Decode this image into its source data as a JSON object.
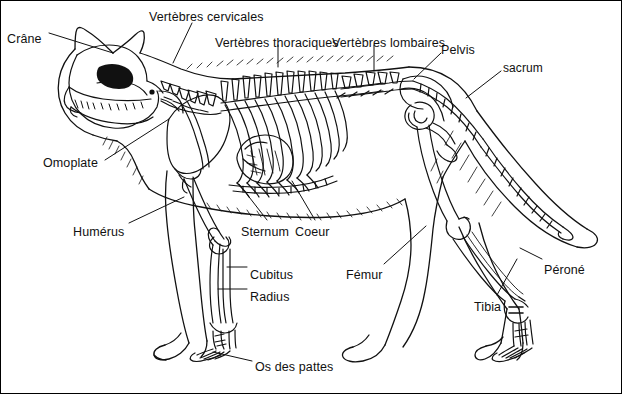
{
  "figure": {
    "language": "fr",
    "style": "line-drawing",
    "ink_color": "#111111",
    "background_color": "#ffffff",
    "border_color": "#000000",
    "width": 622,
    "height": 394
  },
  "labels": [
    {
      "id": "crane",
      "text": "Crâne",
      "x": 6,
      "y": 32
    },
    {
      "id": "vertebres-cervicales",
      "text": "Vertèbres cervicales",
      "x": 148,
      "y": 10
    },
    {
      "id": "vertebres-thoraciques",
      "text": "Vertèbres thoraciques",
      "x": 214,
      "y": 36
    },
    {
      "id": "vertebres-lombaires",
      "text": "Vertèbres lombaires",
      "x": 331,
      "y": 36
    },
    {
      "id": "pelvis",
      "text": "Pelvis",
      "x": 440,
      "y": 43
    },
    {
      "id": "sacrum",
      "text": "sacrum",
      "x": 502,
      "y": 61
    },
    {
      "id": "omoplate",
      "text": "Omoplate",
      "x": 42,
      "y": 156
    },
    {
      "id": "humerus",
      "text": "Humérus",
      "x": 72,
      "y": 225
    },
    {
      "id": "sternum",
      "text": "Sternum",
      "x": 240,
      "y": 225
    },
    {
      "id": "coeur",
      "text": "Coeur",
      "x": 294,
      "y": 225
    },
    {
      "id": "cubitus",
      "text": "Cubitus",
      "x": 249,
      "y": 268
    },
    {
      "id": "radius",
      "text": "Radius",
      "x": 249,
      "y": 290
    },
    {
      "id": "os-des-pattes",
      "text": "Os des pattes",
      "x": 254,
      "y": 360
    },
    {
      "id": "femur",
      "text": "Fémur",
      "x": 345,
      "y": 268
    },
    {
      "id": "tibia",
      "text": "Tibia",
      "x": 473,
      "y": 300
    },
    {
      "id": "perone",
      "text": "Péroné",
      "x": 543,
      "y": 263
    }
  ],
  "leader_lines": [
    {
      "id": "leader-crane",
      "from": [
        48,
        32
      ],
      "to": [
        112,
        52
      ]
    },
    {
      "id": "leader-vertebres-cervicales",
      "from": [
        191,
        22
      ],
      "to": [
        172,
        62
      ]
    },
    {
      "id": "leader-vertebres-thoraciques",
      "from": [
        277,
        44
      ],
      "to": [
        277,
        66
      ]
    },
    {
      "id": "leader-vertebres-lombaires",
      "from": [
        373,
        44
      ],
      "to": [
        373,
        70
      ]
    },
    {
      "id": "leader-pelvis",
      "from": [
        440,
        52
      ],
      "to": [
        413,
        78
      ]
    },
    {
      "id": "leader-sacrum",
      "from": [
        500,
        70
      ],
      "to": [
        465,
        97
      ]
    },
    {
      "id": "leader-omoplate",
      "from": [
        104,
        159
      ],
      "to": [
        168,
        118
      ]
    },
    {
      "id": "leader-humerus",
      "from": [
        128,
        222
      ],
      "to": [
        183,
        196
      ]
    },
    {
      "id": "leader-sternum",
      "from": [
        266,
        219
      ],
      "to": [
        238,
        183
      ]
    },
    {
      "id": "leader-coeur",
      "from": [
        314,
        219
      ],
      "to": [
        291,
        180
      ]
    },
    {
      "id": "leader-cubitus",
      "from": [
        246,
        266
      ],
      "to": [
        226,
        266
      ]
    },
    {
      "id": "leader-radius",
      "from": [
        246,
        288
      ],
      "to": [
        217,
        288
      ]
    },
    {
      "id": "leader-os-des-pattes",
      "from": [
        251,
        360
      ],
      "to": [
        212,
        351
      ]
    },
    {
      "id": "leader-femur",
      "from": [
        383,
        263
      ],
      "to": [
        425,
        225
      ]
    },
    {
      "id": "leader-tibia",
      "from": [
        496,
        294
      ],
      "to": [
        516,
        258
      ]
    },
    {
      "id": "leader-perone",
      "from": [
        541,
        258
      ],
      "to": [
        519,
        247
      ]
    }
  ]
}
